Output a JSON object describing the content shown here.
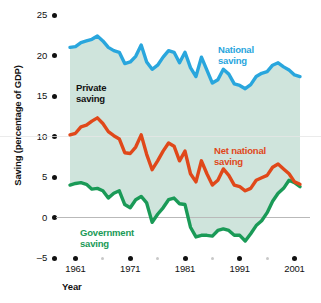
{
  "chart_data": {
    "type": "line",
    "title": "",
    "xlabel": "Year",
    "ylabel": "Saving (percentage of GDP)",
    "xlim": [
      1959,
      2002
    ],
    "ylim": [
      -5,
      25
    ],
    "yticks": [
      25,
      20,
      15,
      10,
      5,
      0,
      -5
    ],
    "ytick_labels": [
      "25",
      "20",
      "15",
      "10",
      "5",
      "0",
      "–5"
    ],
    "xticks": [
      1961,
      1971,
      1981,
      1991,
      2001
    ],
    "xtick_labels": [
      "1961",
      "1971",
      "1981",
      "1991",
      "2001"
    ],
    "xticks_minor": [
      1966,
      1976,
      1986,
      1996
    ],
    "grid": false,
    "zero_line": true,
    "shaded_band": {
      "between": [
        "Government saving",
        "National saving"
      ],
      "label": "Private saving",
      "color": "#cfe4dc"
    },
    "x": [
      1960,
      1961,
      1962,
      1963,
      1964,
      1965,
      1966,
      1967,
      1968,
      1969,
      1970,
      1971,
      1972,
      1973,
      1974,
      1975,
      1976,
      1977,
      1978,
      1979,
      1980,
      1981,
      1982,
      1983,
      1984,
      1985,
      1986,
      1987,
      1988,
      1989,
      1990,
      1991,
      1992,
      1993,
      1994,
      1995,
      1996,
      1997,
      1998,
      1999,
      2000,
      2001,
      2002
    ],
    "series": [
      {
        "name": "National saving",
        "color": "#29a6dd",
        "values": [
          21.0,
          21.1,
          21.6,
          21.8,
          22.0,
          22.4,
          21.8,
          21.0,
          20.6,
          20.4,
          19.0,
          19.2,
          19.9,
          21.3,
          19.2,
          18.3,
          18.8,
          19.8,
          20.6,
          20.4,
          19.1,
          20.4,
          18.5,
          17.4,
          19.8,
          18.2,
          16.6,
          17.0,
          18.3,
          17.7,
          16.5,
          16.3,
          15.9,
          16.4,
          17.4,
          17.8,
          18.0,
          18.8,
          19.1,
          18.6,
          18.2,
          17.6,
          17.4
        ]
      },
      {
        "name": "Net national saving",
        "color": "#e0481a",
        "values": [
          10.2,
          10.4,
          11.2,
          11.4,
          11.9,
          12.3,
          11.6,
          10.6,
          10.1,
          9.7,
          8.0,
          7.9,
          8.7,
          10.2,
          7.8,
          5.9,
          7.0,
          8.2,
          9.2,
          8.8,
          7.0,
          8.2,
          5.4,
          4.4,
          7.0,
          5.4,
          4.0,
          4.6,
          6.0,
          5.2,
          4.0,
          3.8,
          3.3,
          3.6,
          4.6,
          4.9,
          5.2,
          6.2,
          6.6,
          6.0,
          5.4,
          4.4,
          4.1
        ]
      },
      {
        "name": "Government saving",
        "color": "#1a9a57",
        "values": [
          4.0,
          4.2,
          4.3,
          4.1,
          3.5,
          3.6,
          3.3,
          2.4,
          3.0,
          3.3,
          1.6,
          1.2,
          2.2,
          2.6,
          1.8,
          -0.6,
          0.4,
          1.2,
          2.2,
          2.4,
          1.7,
          1.6,
          -1.2,
          -2.4,
          -2.2,
          -2.2,
          -2.3,
          -1.6,
          -1.4,
          -1.6,
          -2.2,
          -2.2,
          -2.9,
          -2.0,
          -1.0,
          -0.4,
          0.6,
          2.0,
          3.0,
          3.6,
          4.6,
          4.3,
          3.8
        ]
      }
    ],
    "annotations": [
      {
        "text_line1": "National",
        "text_line2": "saving",
        "color": "#29a6dd",
        "x_px": 218,
        "y_px": 44
      },
      {
        "text_line1": "Private",
        "text_line2": "saving",
        "color": "#111111",
        "x_px": 76,
        "y_px": 82
      },
      {
        "text_line1": "Net national",
        "text_line2": "saving",
        "color": "#e0481a",
        "x_px": 214,
        "y_px": 145
      },
      {
        "text_line1": "Government",
        "text_line2": "saving",
        "color": "#1a9a57",
        "x_px": 80,
        "y_px": 227
      }
    ]
  },
  "axis": {
    "y_title": "Saving (percentage of GDP)",
    "x_title": "Year"
  }
}
